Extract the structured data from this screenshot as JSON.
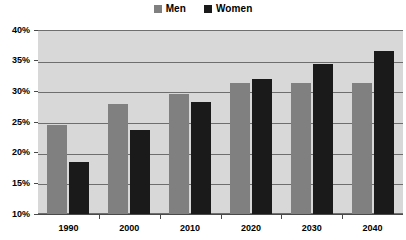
{
  "chart_data": {
    "type": "bar",
    "title": "",
    "subtitle": "",
    "xlabel": "",
    "ylabel": "",
    "categories": [
      "1990",
      "2000",
      "2010",
      "2020",
      "2030",
      "2040"
    ],
    "series": [
      {
        "name": "Men",
        "color": "#808080",
        "values": [
          24.5,
          27.9,
          29.6,
          31.3,
          31.3,
          31.3
        ]
      },
      {
        "name": "Women",
        "color": "#1a1a1a",
        "values": [
          18.5,
          23.7,
          28.2,
          32.0,
          34.5,
          36.5
        ]
      }
    ],
    "ylim": [
      10,
      40
    ],
    "ytick_step": 5,
    "ytick_labels": [
      "40%",
      "35%",
      "30%",
      "25%",
      "20%",
      "15%",
      "10%"
    ],
    "ytick_values": [
      40,
      35,
      30,
      25,
      20,
      15,
      10
    ],
    "grid": true,
    "grid_axis": "y",
    "legend_position": "top-center",
    "plot_background": "#d8d8d8",
    "page_background": "#ffffff",
    "grid_color": "#6e6e6e",
    "axis_color": "#4a4a4a",
    "value_unit": "%"
  },
  "legend": {
    "entries": [
      {
        "label": "Men",
        "color": "#808080"
      },
      {
        "label": "Women",
        "color": "#1a1a1a"
      }
    ]
  }
}
